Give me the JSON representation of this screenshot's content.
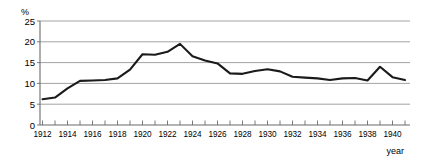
{
  "chart_data": {
    "type": "line",
    "title": "",
    "xlabel": "year",
    "ylabel": "%",
    "ylim": [
      0,
      25
    ],
    "xlim": [
      1912,
      1941
    ],
    "grid": true,
    "legend": false,
    "y_ticks": [
      25,
      20,
      15,
      10,
      5,
      0
    ],
    "x_ticks": [
      1912,
      1914,
      1916,
      1918,
      1920,
      1922,
      1924,
      1926,
      1928,
      1930,
      1932,
      1934,
      1936,
      1938,
      1940
    ],
    "x_minor_ticks": [
      1913,
      1915,
      1917,
      1919,
      1921,
      1923,
      1925,
      1927,
      1929,
      1931,
      1933,
      1935,
      1937,
      1939,
      1941
    ],
    "x": [
      1912,
      1913,
      1914,
      1915,
      1916,
      1917,
      1918,
      1919,
      1920,
      1921,
      1922,
      1923,
      1924,
      1925,
      1926,
      1927,
      1928,
      1929,
      1930,
      1931,
      1932,
      1933,
      1934,
      1935,
      1936,
      1937,
      1938,
      1939,
      1940,
      1941
    ],
    "values": [
      6.2,
      6.6,
      8.8,
      10.6,
      10.7,
      10.8,
      11.2,
      13.3,
      17.0,
      16.9,
      17.6,
      19.5,
      16.5,
      15.5,
      14.8,
      12.4,
      12.3,
      13.0,
      13.4,
      12.9,
      11.6,
      11.4,
      11.2,
      10.8,
      11.2,
      11.3,
      10.7,
      14.0,
      11.5,
      10.8
    ],
    "series_name": "",
    "line_color": "#1a1a1a",
    "grid_color": "#8c8c8c",
    "axis_color": "#6b6b6b",
    "background": "#ffffff"
  },
  "axes": {
    "y_unit_label": "%",
    "x_axis_label": "year"
  }
}
